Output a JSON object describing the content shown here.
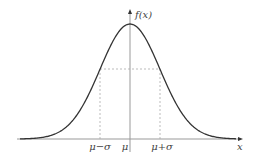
{
  "diagram": {
    "y_axis_label": "f(x)",
    "x_axis_label": "x",
    "tick_labels": {
      "mu_minus_sigma": "μ−σ",
      "mu": "μ",
      "mu_plus_sigma": "μ+σ"
    },
    "colors": {
      "curve": "#333333",
      "axis": "#999999",
      "guide": "#aaaaaa",
      "text": "#444444"
    }
  }
}
